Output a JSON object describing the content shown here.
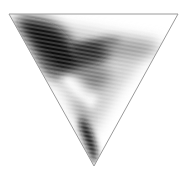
{
  "figure": {
    "shape": "inverted-triangle",
    "background": "#ffffff",
    "outline_color": "#9a9a9a",
    "vertices": [
      [
        9,
        14
      ],
      [
        178,
        14
      ],
      [
        94,
        166
      ]
    ],
    "shading": "grayscale density field",
    "dark_color": "#111111",
    "light_color": "#ffffff"
  }
}
